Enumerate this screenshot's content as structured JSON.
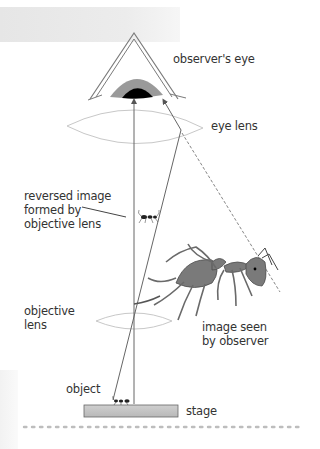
{
  "diagram": {
    "labels": {
      "observers_eye": "observer's eye",
      "eye_lens": "eye lens",
      "reversed_image": "reversed image\nformed by\nobjective lens",
      "objective_lens": "objective\nlens",
      "image_seen": "image seen\nby observer",
      "object": "object",
      "stage": "stage"
    },
    "components": [
      {
        "id": "observers-eye",
        "type": "eye"
      },
      {
        "id": "eye-lens",
        "type": "convex-lens"
      },
      {
        "id": "reversed-image",
        "type": "small-ant-image"
      },
      {
        "id": "image-seen",
        "type": "large-ant-image"
      },
      {
        "id": "objective-lens",
        "type": "convex-lens"
      },
      {
        "id": "object",
        "type": "small-ant"
      },
      {
        "id": "stage",
        "type": "rectangle"
      }
    ],
    "colors": {
      "line": "#555555",
      "lens": "#c8c8c8",
      "iris": "#9a9a9a",
      "pupil": "#000000",
      "stage": "#c4c4c4",
      "ant": "#6e6e6e",
      "dots": "#bdbdbd"
    }
  }
}
